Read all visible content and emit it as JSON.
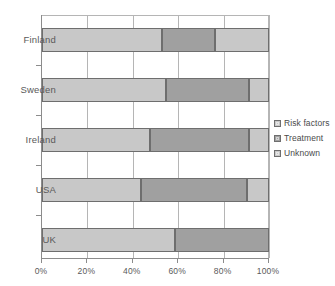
{
  "chart_data": {
    "type": "bar",
    "orientation": "horizontal",
    "stacked": true,
    "stack_mode": "percent",
    "title": "",
    "subtitle": "",
    "xlabel": "",
    "ylabel": "",
    "xlim": [
      0,
      100
    ],
    "xticks": [
      0,
      20,
      40,
      60,
      80,
      100
    ],
    "xticklabels": [
      "0%",
      "20%",
      "40%",
      "60%",
      "80%",
      "100%"
    ],
    "grid": true,
    "grid_axis": "x",
    "legend_position": "right",
    "categories": [
      "Finland",
      "Sweden",
      "Ireland",
      "USA",
      "UK"
    ],
    "series": [
      {
        "name": "Risk factors",
        "color": "#c8c8c8",
        "values": [
          53,
          54.5,
          47.5,
          43.5,
          58.5
        ]
      },
      {
        "name": "Treatment",
        "color": "#a0a0a0",
        "values": [
          23,
          36.5,
          43.5,
          47,
          41.5
        ]
      },
      {
        "name": "Unknown",
        "color": "#c8c8c8",
        "values": [
          24,
          9,
          9,
          9.5,
          0
        ]
      }
    ]
  },
  "legend": {
    "items": [
      {
        "label": "Risk factors",
        "color": "#c8c8c8"
      },
      {
        "label": "Treatment",
        "color": "#a0a0a0"
      },
      {
        "label": "Unknown",
        "color": "#c8c8c8"
      }
    ]
  },
  "axis": {
    "x_tick_labels": [
      "0%",
      "20%",
      "40%",
      "60%",
      "80%",
      "100%"
    ],
    "y_tick_labels": [
      "Finland",
      "Sweden",
      "Ireland",
      "USA",
      "UK"
    ]
  },
  "colors": {
    "risk_factors": "#c8c8c8",
    "treatment": "#a0a0a0",
    "unknown": "#c8c8c8",
    "segment_border": "#6e6e6e",
    "axis": "#8c8c8c",
    "gridline": "#b5b5b5",
    "text": "#4a4a4a",
    "background": "#ffffff"
  }
}
